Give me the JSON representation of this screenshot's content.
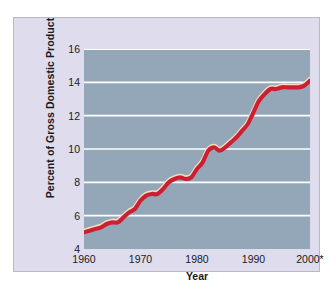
{
  "chart_data": {
    "type": "line",
    "title": "",
    "xlabel": "Year",
    "ylabel": "Percent of Gross Domestic Product",
    "xlim": [
      1960,
      2000
    ],
    "ylim": [
      4,
      16
    ],
    "xticks": [
      "1960",
      "1970",
      "1980",
      "1990",
      "2000*"
    ],
    "xtick_values": [
      1960,
      1970,
      1980,
      1990,
      2000
    ],
    "yticks": [
      "4",
      "6",
      "8",
      "10",
      "12",
      "14",
      "16"
    ],
    "ytick_values": [
      4,
      6,
      8,
      10,
      12,
      14,
      16
    ],
    "grid": "horizontal",
    "legend": "none",
    "series": [
      {
        "name": "Health expenditures as percent of GDP",
        "color": "#cc1f33",
        "highlight_color": "#f2dfc0",
        "x": [
          1960,
          1961,
          1962,
          1963,
          1964,
          1965,
          1966,
          1967,
          1968,
          1969,
          1970,
          1971,
          1972,
          1973,
          1974,
          1975,
          1976,
          1977,
          1978,
          1979,
          1980,
          1981,
          1982,
          1983,
          1984,
          1985,
          1986,
          1987,
          1988,
          1989,
          1990,
          1991,
          1992,
          1993,
          1994,
          1995,
          1996,
          1997,
          1998,
          1999,
          2000
        ],
        "values": [
          5.0,
          5.1,
          5.2,
          5.3,
          5.5,
          5.6,
          5.6,
          5.9,
          6.2,
          6.4,
          6.9,
          7.2,
          7.3,
          7.3,
          7.6,
          8.0,
          8.2,
          8.3,
          8.2,
          8.3,
          8.8,
          9.2,
          9.9,
          10.1,
          9.9,
          10.1,
          10.4,
          10.7,
          11.1,
          11.5,
          12.2,
          12.9,
          13.3,
          13.6,
          13.6,
          13.7,
          13.7,
          13.7,
          13.7,
          13.8,
          14.1
        ]
      }
    ]
  },
  "axis": {
    "y_title": "Percent of Gross Domestic Product",
    "x_title": "Year"
  },
  "colors": {
    "panel_background": "#dedced",
    "plot_background": "#94a7b8",
    "gridline": "#ffffff",
    "line": "#cc1f33",
    "line_highlight": "#f2dfc0",
    "text": "#1a1a22"
  }
}
